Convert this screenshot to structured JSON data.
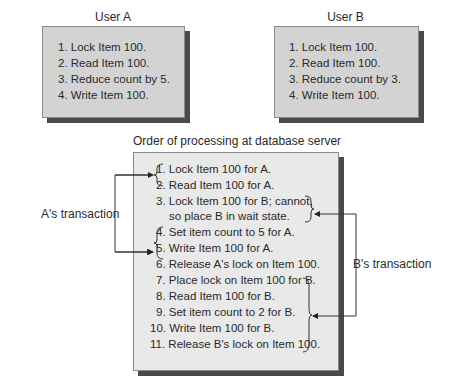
{
  "user_a": {
    "title": "User A",
    "steps": [
      "1. Lock Item 100.",
      "2. Read Item 100.",
      "3. Reduce count by 5.",
      "4. Write Item 100."
    ]
  },
  "user_b": {
    "title": "User B",
    "steps": [
      "1. Lock Item 100.",
      "2. Read Item 100.",
      "3. Reduce count by 3.",
      "4. Write Item 100."
    ]
  },
  "server": {
    "title": "Order of processing at database server",
    "steps": [
      "1. Lock Item 100 for A.",
      "2. Read Item 100 for A.",
      "3. Lock Item 100 for B; cannot,",
      "so place B in wait state.",
      "4. Set item count to 5 for A.",
      "5. Write Item 100 for A.",
      "6. Release A's lock on Item 100.",
      "7. Place lock on Item 100 for B.",
      "8. Read Item 100 for B.",
      "9. Set item count to 2 for B.",
      "10. Write Item 100 for B.",
      "11. Release B's lock on Item 100."
    ]
  },
  "annotations": {
    "a_transaction": "A's transaction",
    "b_transaction": "B's transaction"
  },
  "colors": {
    "box_fill": "#d3d3d3",
    "server_fill": "#e9e9e9",
    "shadow": "#4a4a4a",
    "text": "#2a2a2a"
  }
}
